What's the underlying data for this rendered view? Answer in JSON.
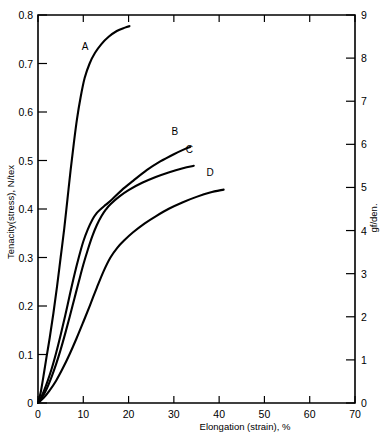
{
  "chart_data": {
    "type": "line",
    "title": "",
    "xlabel": "Elongation (strain), %",
    "ylabel": "Tenacity(stress), N/tex",
    "ylabel_right": "gf/den.",
    "xlim": [
      0,
      70
    ],
    "ylim": [
      0,
      0.8
    ],
    "ylim_right": [
      0,
      9
    ],
    "grid": false,
    "legend": "inline-curve-labels",
    "xticks": [
      0,
      10,
      20,
      30,
      40,
      50,
      60,
      70
    ],
    "xtick_labels": [
      "0",
      "10",
      "20",
      "30",
      "40",
      "50",
      "60",
      "70"
    ],
    "yticks": [
      0,
      0.1,
      0.2,
      0.3,
      0.4,
      0.5,
      0.6,
      0.7,
      0.8
    ],
    "ytick_labels": [
      "0",
      "0.1",
      "0.2",
      "0.3",
      "0.4",
      "0.5",
      "0.6",
      "0.7",
      "0.8"
    ],
    "yticks_right": [
      0,
      1,
      2,
      3,
      4,
      5,
      6,
      7,
      8,
      9
    ],
    "ytick_labels_right": [
      "0",
      "1",
      "2",
      "3",
      "4",
      "5",
      "6",
      "7",
      "8",
      "9"
    ],
    "series": [
      {
        "name": "A",
        "label": "A",
        "label_x": 10.4,
        "label_y": 0.727,
        "points": [
          [
            0.0,
            0.0
          ],
          [
            0.6,
            0.022
          ],
          [
            1.2,
            0.055
          ],
          [
            1.8,
            0.09
          ],
          [
            2.6,
            0.135
          ],
          [
            3.4,
            0.185
          ],
          [
            4.2,
            0.24
          ],
          [
            5.0,
            0.3
          ],
          [
            5.8,
            0.36
          ],
          [
            6.5,
            0.42
          ],
          [
            7.2,
            0.48
          ],
          [
            7.9,
            0.535
          ],
          [
            8.6,
            0.585
          ],
          [
            9.4,
            0.63
          ],
          [
            10.3,
            0.67
          ],
          [
            11.4,
            0.7
          ],
          [
            12.6,
            0.722
          ],
          [
            14.0,
            0.74
          ],
          [
            15.6,
            0.755
          ],
          [
            17.4,
            0.767
          ],
          [
            19.2,
            0.774
          ],
          [
            20.2,
            0.777
          ]
        ]
      },
      {
        "name": "B",
        "label": "B",
        "label_x": 30.2,
        "label_y": 0.553,
        "points": [
          [
            0.0,
            0.0
          ],
          [
            1.0,
            0.018
          ],
          [
            2.0,
            0.042
          ],
          [
            3.0,
            0.07
          ],
          [
            4.0,
            0.103
          ],
          [
            5.0,
            0.14
          ],
          [
            6.0,
            0.18
          ],
          [
            7.0,
            0.222
          ],
          [
            8.0,
            0.263
          ],
          [
            9.0,
            0.3
          ],
          [
            10.0,
            0.333
          ],
          [
            11.0,
            0.358
          ],
          [
            12.0,
            0.378
          ],
          [
            13.0,
            0.392
          ],
          [
            14.0,
            0.401
          ],
          [
            15.0,
            0.409
          ],
          [
            16.5,
            0.421
          ],
          [
            18.5,
            0.439
          ],
          [
            21.0,
            0.458
          ],
          [
            24.0,
            0.48
          ],
          [
            27.0,
            0.498
          ],
          [
            30.0,
            0.513
          ],
          [
            32.5,
            0.524
          ],
          [
            33.6,
            0.528
          ]
        ]
      },
      {
        "name": "C",
        "label": "C",
        "label_x": 33.4,
        "label_y": 0.515,
        "points": [
          [
            0.0,
            0.0
          ],
          [
            1.0,
            0.013
          ],
          [
            2.0,
            0.031
          ],
          [
            3.0,
            0.054
          ],
          [
            4.0,
            0.08
          ],
          [
            5.0,
            0.11
          ],
          [
            6.0,
            0.143
          ],
          [
            7.0,
            0.178
          ],
          [
            8.0,
            0.214
          ],
          [
            9.0,
            0.25
          ],
          [
            10.0,
            0.285
          ],
          [
            11.0,
            0.316
          ],
          [
            12.0,
            0.344
          ],
          [
            13.0,
            0.367
          ],
          [
            14.0,
            0.385
          ],
          [
            15.0,
            0.399
          ],
          [
            16.0,
            0.41
          ],
          [
            18.0,
            0.426
          ],
          [
            20.0,
            0.439
          ],
          [
            23.0,
            0.454
          ],
          [
            26.0,
            0.466
          ],
          [
            29.0,
            0.476
          ],
          [
            32.0,
            0.484
          ],
          [
            34.4,
            0.489
          ]
        ]
      },
      {
        "name": "D",
        "label": "D",
        "label_x": 38.0,
        "label_y": 0.468,
        "points": [
          [
            0.0,
            0.0
          ],
          [
            1.2,
            0.01
          ],
          [
            2.5,
            0.025
          ],
          [
            4.0,
            0.046
          ],
          [
            5.5,
            0.072
          ],
          [
            7.0,
            0.101
          ],
          [
            8.5,
            0.133
          ],
          [
            10.0,
            0.167
          ],
          [
            11.5,
            0.202
          ],
          [
            13.0,
            0.238
          ],
          [
            14.5,
            0.272
          ],
          [
            16.0,
            0.3
          ],
          [
            17.5,
            0.32
          ],
          [
            19.0,
            0.335
          ],
          [
            21.0,
            0.352
          ],
          [
            23.5,
            0.37
          ],
          [
            26.0,
            0.385
          ],
          [
            29.0,
            0.401
          ],
          [
            32.0,
            0.414
          ],
          [
            35.0,
            0.425
          ],
          [
            38.0,
            0.434
          ],
          [
            41.0,
            0.44
          ]
        ]
      }
    ]
  }
}
